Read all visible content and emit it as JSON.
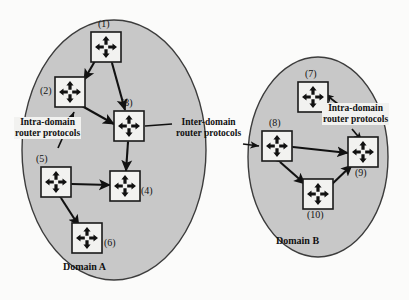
{
  "figure": {
    "type": "network-diagram",
    "background_color": "#fbfbfa",
    "domain_fill_color": "#c8c8c8",
    "domain_stroke_color": "#3c3c3c",
    "node_fill_color": "#f2f2f0",
    "node_stroke_color": "#1a1a1a",
    "arrow_color": "#111111"
  },
  "domains": [
    {
      "id": "domain-a",
      "caption": "Domain A",
      "caption_pos": {
        "x": 63,
        "y": 266
      },
      "ellipse": {
        "cx": 114,
        "cy": 150,
        "rx": 92,
        "ry": 130
      }
    },
    {
      "id": "domain-b",
      "caption": "Domain B",
      "caption_pos": {
        "x": 275,
        "y": 240
      },
      "ellipse": {
        "cx": 318,
        "cy": 157,
        "rx": 70,
        "ry": 100
      }
    }
  ],
  "routers": [
    {
      "id": "r1",
      "label": "(1)",
      "x": 106,
      "y": 47,
      "label_x": 98,
      "label_y": 25,
      "icon": "router-cross-arrows-icon"
    },
    {
      "id": "r2",
      "label": "(2)",
      "x": 70,
      "y": 92,
      "label_x": 40,
      "label_y": 87,
      "icon": "router-cross-arrows-icon"
    },
    {
      "id": "r3",
      "label": "(3)",
      "x": 129,
      "y": 126,
      "label_x": 123,
      "label_y": 104,
      "icon": "router-cross-arrows-icon"
    },
    {
      "id": "r4",
      "label": "(4)",
      "x": 125,
      "y": 186,
      "label_x": 139,
      "label_y": 189,
      "icon": "router-cross-arrows-icon"
    },
    {
      "id": "r5",
      "label": "(5)",
      "x": 56,
      "y": 182,
      "label_x": 36,
      "label_y": 160,
      "icon": "router-cross-arrows-icon"
    },
    {
      "id": "r6",
      "label": "(6)",
      "x": 87,
      "y": 238,
      "label_x": 101,
      "label_y": 240,
      "icon": "router-cross-arrows-icon"
    },
    {
      "id": "r7",
      "label": "(7)",
      "x": 313,
      "y": 97,
      "label_x": 306,
      "label_y": 75,
      "icon": "router-cross-arrows-icon"
    },
    {
      "id": "r8",
      "label": "(8)",
      "x": 277,
      "y": 146,
      "label_x": 270,
      "label_y": 124,
      "icon": "router-cross-arrows-icon"
    },
    {
      "id": "r9",
      "label": "(9)",
      "x": 363,
      "y": 152,
      "label_x": 356,
      "label_y": 171,
      "icon": "router-cross-arrows-icon"
    },
    {
      "id": "r10",
      "label": "(10)",
      "x": 318,
      "y": 194,
      "label_x": 308,
      "label_y": 213,
      "icon": "router-cross-arrows-icon"
    }
  ],
  "links": [
    {
      "from": "r1",
      "to": "r2",
      "direction": "both"
    },
    {
      "from": "r1",
      "to": "r3",
      "direction": "both"
    },
    {
      "from": "r2",
      "to": "r3",
      "direction": "both"
    },
    {
      "from": "r3",
      "to": "r4",
      "direction": "both"
    },
    {
      "from": "r5",
      "to": "r4",
      "direction": "both"
    },
    {
      "from": "r5",
      "to": "r6",
      "direction": "both"
    },
    {
      "from": "r8",
      "to": "r9",
      "direction": "both"
    },
    {
      "from": "r8",
      "to": "r10",
      "direction": "both"
    },
    {
      "from": "r10",
      "to": "r9",
      "direction": "both"
    }
  ],
  "annotations": {
    "intra_domain_a": {
      "line1": "Intra-domain",
      "line2": "router protocols",
      "x": 16,
      "y": 119,
      "target": "r2"
    },
    "intra_domain_b": {
      "line1": "Intra-domain",
      "line2": "router protocols",
      "x": 323,
      "y": 105,
      "target": "r7"
    },
    "inter_domain": {
      "line1": "Inter-domain",
      "line2": "router protocols",
      "x": 176,
      "y": 118,
      "target_left": "r3",
      "target_right": "r8"
    }
  }
}
